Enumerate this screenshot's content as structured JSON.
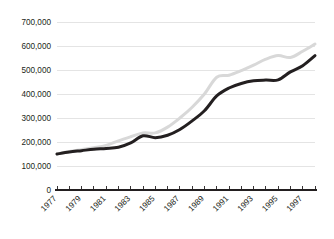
{
  "chart_data": {
    "type": "line",
    "title": "",
    "subtitle": "",
    "xlabel": "",
    "ylabel": "",
    "grid": "horizontal",
    "legend": "none",
    "xlim": [
      1977,
      1998
    ],
    "ylim": [
      0,
      700000
    ],
    "ytick_labels": [
      "700,000",
      "600,000",
      "500,000",
      "400,000",
      "300,000",
      "200,000",
      "100,000",
      "0"
    ],
    "ytick_values": [
      700000,
      600000,
      500000,
      400000,
      300000,
      200000,
      100000,
      0
    ],
    "x": [
      1977,
      1978,
      1979,
      1980,
      1981,
      1982,
      1983,
      1984,
      1985,
      1986,
      1987,
      1988,
      1989,
      1990,
      1991,
      1992,
      1993,
      1994,
      1995,
      1996,
      1997,
      1998
    ],
    "xtick_labels": [
      "1977",
      "",
      "1979",
      "",
      "1981",
      "",
      "1983",
      "",
      "1985",
      "",
      "1987",
      "",
      "1989",
      "",
      "1991",
      "",
      "1993",
      "",
      "1995",
      "",
      "1997",
      ""
    ],
    "xtick_labels_shown": [
      "1977",
      "1979",
      "1981",
      "1983",
      "1985",
      "1987",
      "1989",
      "1991",
      "1993",
      "1995",
      "1997"
    ],
    "series": [
      {
        "name": "upper-series",
        "color": "#d8d8d8",
        "values": [
          150000,
          160000,
          168000,
          176000,
          186000,
          205000,
          222000,
          238000,
          238000,
          262000,
          300000,
          345000,
          400000,
          470000,
          478000,
          497000,
          520000,
          545000,
          560000,
          552000,
          578000,
          608000
        ]
      },
      {
        "name": "lower-series",
        "color": "#231f20",
        "values": [
          150000,
          158000,
          164000,
          170000,
          173000,
          178000,
          196000,
          226000,
          218000,
          228000,
          252000,
          288000,
          330000,
          392000,
          425000,
          444000,
          455000,
          458000,
          459000,
          492000,
          518000,
          560000
        ]
      }
    ]
  }
}
